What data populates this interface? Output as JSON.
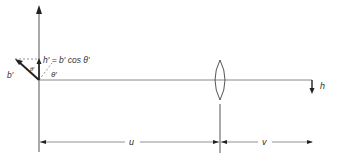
{
  "diagram": {
    "labels": {
      "h_prime_eq": "h′ = b′ cos θ′",
      "b_prime": "b′",
      "theta_prime_upper": "θ′",
      "theta_prime_lower": "θ′",
      "h": "h",
      "u": "u",
      "v": "v"
    },
    "colors": {
      "line": "#555555",
      "bold": "#222222",
      "dashed": "#777777"
    }
  }
}
